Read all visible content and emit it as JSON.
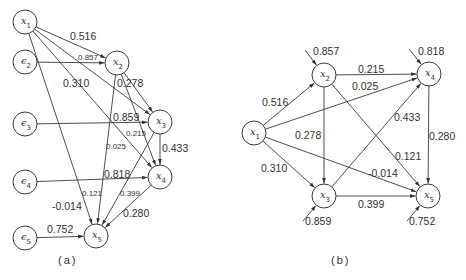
{
  "panel_a": {
    "caption": "(a)",
    "nodes": [
      {
        "id": "x1",
        "symbol": "x",
        "sub": "1",
        "cx": 25,
        "cy": 22
      },
      {
        "id": "e2",
        "symbol": "ϵ",
        "sub": "2",
        "cx": 25,
        "cy": 62
      },
      {
        "id": "e3",
        "symbol": "ϵ",
        "sub": "3",
        "cx": 25,
        "cy": 124
      },
      {
        "id": "e4",
        "symbol": "ϵ",
        "sub": "4",
        "cx": 25,
        "cy": 182
      },
      {
        "id": "e5",
        "symbol": "ϵ",
        "sub": "5",
        "cx": 25,
        "cy": 238
      },
      {
        "id": "x2",
        "symbol": "x",
        "sub": "2",
        "cx": 117,
        "cy": 63
      },
      {
        "id": "x3",
        "symbol": "x",
        "sub": "3",
        "cx": 160,
        "cy": 122
      },
      {
        "id": "x4",
        "symbol": "x",
        "sub": "4",
        "cx": 160,
        "cy": 177
      },
      {
        "id": "x5",
        "symbol": "x",
        "sub": "5",
        "cx": 96,
        "cy": 236
      }
    ],
    "edges": [
      {
        "from": "x1",
        "to": "x2",
        "weight": "0.516",
        "lx": 70,
        "ly": 40,
        "small": false
      },
      {
        "from": "e2",
        "to": "x2",
        "weight": "0.857",
        "lx": 78,
        "ly": 60,
        "small": true
      },
      {
        "from": "x1",
        "to": "x3",
        "weight": "0.310",
        "lx": 63,
        "ly": 87,
        "small": false
      },
      {
        "from": "x2",
        "to": "x3",
        "weight": "0.278",
        "lx": 117,
        "ly": 87,
        "small": false
      },
      {
        "from": "e3",
        "to": "x3",
        "weight": "0.859",
        "lx": 113,
        "ly": 121,
        "small": false
      },
      {
        "from": "x1",
        "to": "x4",
        "weight": "0.025",
        "lx": 106,
        "ly": 149,
        "small": true
      },
      {
        "from": "x2",
        "to": "x4",
        "weight": "0.215",
        "lx": 126,
        "ly": 136,
        "small": true
      },
      {
        "from": "x3",
        "to": "x4",
        "weight": "0.433",
        "lx": 162,
        "ly": 152,
        "small": false
      },
      {
        "from": "e4",
        "to": "x4",
        "weight": "0.818",
        "lx": 104,
        "ly": 178,
        "small": false
      },
      {
        "from": "x1",
        "to": "x5",
        "weight": "-0.014",
        "lx": 52,
        "ly": 210,
        "small": false
      },
      {
        "from": "x2",
        "to": "x5",
        "weight": "0.121",
        "lx": 82,
        "ly": 196,
        "small": true
      },
      {
        "from": "x3",
        "to": "x5",
        "weight": "0.399",
        "lx": 120,
        "ly": 196,
        "small": true
      },
      {
        "from": "x4",
        "to": "x5",
        "weight": "0.280",
        "lx": 123,
        "ly": 217,
        "small": false
      },
      {
        "from": "e5",
        "to": "x5",
        "weight": "0.752",
        "lx": 47,
        "ly": 233,
        "small": false
      }
    ]
  },
  "panel_b": {
    "caption": "(b)",
    "nodes": [
      {
        "id": "x1",
        "symbol": "x",
        "sub": "1",
        "cx": 254,
        "cy": 133
      },
      {
        "id": "x2",
        "symbol": "x",
        "sub": "2",
        "cx": 324,
        "cy": 75
      },
      {
        "id": "x3",
        "symbol": "x",
        "sub": "3",
        "cx": 324,
        "cy": 196
      },
      {
        "id": "x4",
        "symbol": "x",
        "sub": "4",
        "cx": 429,
        "cy": 74
      },
      {
        "id": "x5",
        "symbol": "x",
        "sub": "5",
        "cx": 428,
        "cy": 196
      }
    ],
    "edges": [
      {
        "from": "x1",
        "to": "x2",
        "weight": "0.516",
        "lx": 262,
        "ly": 106
      },
      {
        "from": "x1",
        "to": "x3",
        "weight": "0.310",
        "lx": 261,
        "ly": 172
      },
      {
        "from": "x1",
        "to": "x4",
        "weight": "0.025",
        "lx": 352,
        "ly": 90
      },
      {
        "from": "x1",
        "to": "x5",
        "weight": "-0.014",
        "lx": 368,
        "ly": 177
      },
      {
        "from": "x2",
        "to": "x4",
        "weight": "0.215",
        "lx": 358,
        "ly": 73
      },
      {
        "from": "x2",
        "to": "x3",
        "weight": "0.278",
        "lx": 295,
        "ly": 139
      },
      {
        "from": "x2",
        "to": "x5",
        "weight": "0.121",
        "lx": 395,
        "ly": 160
      },
      {
        "from": "x3",
        "to": "x4",
        "weight": "0.433",
        "lx": 394,
        "ly": 121
      },
      {
        "from": "x3",
        "to": "x5",
        "weight": "0.399",
        "lx": 358,
        "ly": 208
      },
      {
        "from": "x4",
        "to": "x5",
        "weight": "0.280",
        "lx": 429,
        "ly": 140
      }
    ],
    "residuals": [
      {
        "node": "x2",
        "weight": "0.857",
        "sx": 305,
        "sy": 50,
        "lx": 313,
        "ly": 55
      },
      {
        "node": "x4",
        "weight": "0.818",
        "sx": 409,
        "sy": 49,
        "lx": 418,
        "ly": 55
      },
      {
        "node": "x3",
        "weight": "0.859",
        "sx": 303,
        "sy": 221,
        "lx": 305,
        "ly": 225
      },
      {
        "node": "x5",
        "weight": "0.752",
        "sx": 407,
        "sy": 221,
        "lx": 409,
        "ly": 225
      }
    ]
  }
}
